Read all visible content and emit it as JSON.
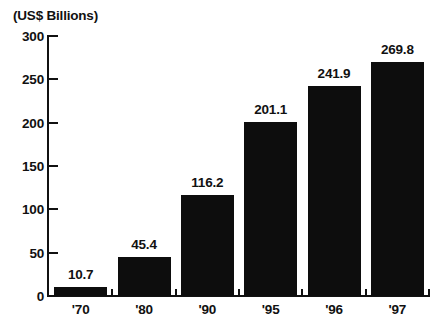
{
  "chart_data": {
    "type": "bar",
    "title": "(US$ Billions)",
    "subtitle": "",
    "xlabel": "",
    "ylabel": "(US$ Billions)",
    "categories": [
      "'70",
      "'80",
      "'90",
      "'95",
      "'96",
      "'97"
    ],
    "values": [
      10.7,
      45.4,
      116.2,
      201.1,
      241.9,
      269.8
    ],
    "value_labels": [
      "10.7",
      "45.4",
      "116.2",
      "201.1",
      "241.9",
      "269.8"
    ],
    "ylim": [
      0,
      300
    ],
    "ytick_values": [
      0,
      50,
      100,
      150,
      200,
      250,
      300
    ],
    "ytick_labels": [
      "0",
      "50",
      "100",
      "150",
      "200",
      "250",
      "300"
    ],
    "grid": false,
    "legend": null,
    "bar_color": "#0d0d0d",
    "axis_color": "#111111",
    "background_color": "#ffffff"
  }
}
